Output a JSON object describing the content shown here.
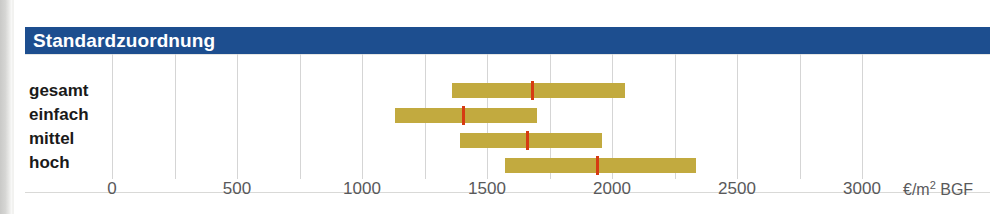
{
  "header": {
    "title": "Standardzuordnung",
    "band_color": "#1d4e8f",
    "text_color": "#ffffff"
  },
  "chart_data": {
    "type": "bar",
    "title": "Standardzuordnung",
    "xlabel": "€/m² BGF",
    "ylabel": "",
    "orientation": "horizontal",
    "bar_style": "range-with-median-marker",
    "bar_color": "#c2aa3f",
    "median_color": "#d63b12",
    "xlim": [
      0,
      3100
    ],
    "grid": true,
    "gridlines": [
      0,
      250,
      500,
      750,
      1000,
      1250,
      1500,
      1750,
      2000,
      2250,
      2500,
      2750,
      3000
    ],
    "xticks": [
      0,
      500,
      1000,
      1500,
      2000,
      2500,
      3000
    ],
    "xticklabels": [
      "0",
      "500",
      "1000",
      "1500",
      "2000",
      "2500",
      "3000"
    ],
    "categories": [
      "gesamt",
      "einfach",
      "mittel",
      "hoch"
    ],
    "ranges": [
      {
        "category": "gesamt",
        "low": 1360,
        "median": 1680,
        "high": 2050
      },
      {
        "category": "einfach",
        "low": 1130,
        "median": 1405,
        "high": 1700
      },
      {
        "category": "mittel",
        "low": 1390,
        "median": 1660,
        "high": 1960
      },
      {
        "category": "hoch",
        "low": 1570,
        "median": 1940,
        "high": 2335
      }
    ]
  }
}
